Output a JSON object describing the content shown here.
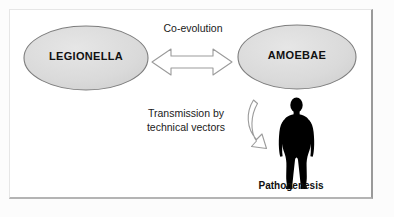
{
  "figure": {
    "title_alt": "Legionella - Amoebae co-evolution and transmission diagram",
    "background_color": "#fcfcfc",
    "panel_color": "#ffffff",
    "panel_border_color": "#9a9a9a"
  },
  "nodes": [
    {
      "id": "legionella",
      "label": "LEGIONELLA",
      "shape": "ellipse",
      "fill": "#dcdcdc",
      "stroke": "#7d7d7d"
    },
    {
      "id": "amoebae",
      "label": "AMOEBAE",
      "shape": "ellipse",
      "fill": "#dcdcdc",
      "stroke": "#7d7d7d"
    }
  ],
  "connectors": [
    {
      "id": "coevolution-arrow",
      "label": "Co-evolution",
      "style": "double-headed-block-arrow",
      "fill": "#ffffff",
      "stroke": "#9b9b9b"
    },
    {
      "id": "transmission-arrow",
      "label_line1": "Transmission  by",
      "label_line2": "technical  vectors",
      "style": "curved-block-arrow",
      "fill": "#ffffff",
      "stroke": "#9b9b9b"
    }
  ],
  "figures": [
    {
      "id": "human-silhouette",
      "caption": "Pathogenesis",
      "fill": "#000000"
    }
  ]
}
